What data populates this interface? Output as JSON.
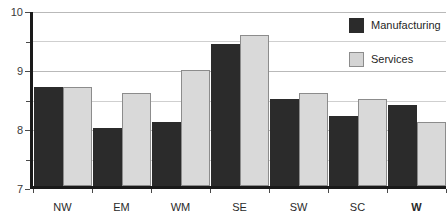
{
  "chart_data": {
    "type": "bar",
    "title": "",
    "subtitle": "",
    "xlabel": "",
    "ylabel": "",
    "categories": [
      "NW",
      "EM",
      "WM",
      "SE",
      "SW",
      "SC",
      "W"
    ],
    "emphasized_categories": [
      "W"
    ],
    "series": [
      {
        "name": "Manufacturing",
        "color": "#2b2b2b",
        "values": [
          8.7,
          8.0,
          8.1,
          9.45,
          8.5,
          8.2,
          8.4
        ]
      },
      {
        "name": "Services",
        "color": "#d9d9d9",
        "values": [
          8.7,
          8.6,
          9.0,
          9.6,
          8.6,
          8.5,
          8.1
        ]
      }
    ],
    "ylim": [
      7,
      10
    ],
    "y_ticks": [
      7,
      8,
      9,
      10
    ],
    "y_tick_labels": [
      "7",
      "8",
      "9",
      "10"
    ],
    "y_minor_gridlines": [
      7.5,
      8.5,
      9.5
    ],
    "grid": true,
    "legend_position": "top-right",
    "legend_entries": [
      "Manufacturing",
      "Services"
    ]
  }
}
